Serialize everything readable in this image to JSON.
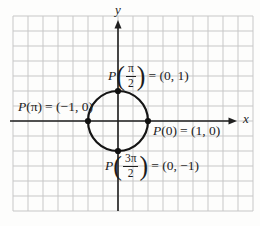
{
  "figure": {
    "colors": {
      "background": "#fdfdfc",
      "grid": "#c7c7c7",
      "axis": "#1f1f1f",
      "circle": "#151515",
      "point": "#111111",
      "text": "#1c1c1c"
    },
    "axes": {
      "x_label": "x",
      "y_label": "y"
    },
    "labels": {
      "top": {
        "p": "P",
        "open": "(",
        "num": "π",
        "den": "2",
        "close": ")",
        "eq": "= (0, 1)"
      },
      "left": {
        "p": "P",
        "open": "(",
        "arg": "π",
        "close": ")",
        "eq": "= (−1, 0)"
      },
      "right": {
        "p": "P",
        "open": "(",
        "arg": "0",
        "close": ")",
        "eq": "= (1, 0)"
      },
      "bottom": {
        "p": "P",
        "open": "(",
        "num": "3π",
        "den": "2",
        "close": ")",
        "eq": "= (0, −1)"
      }
    }
  }
}
